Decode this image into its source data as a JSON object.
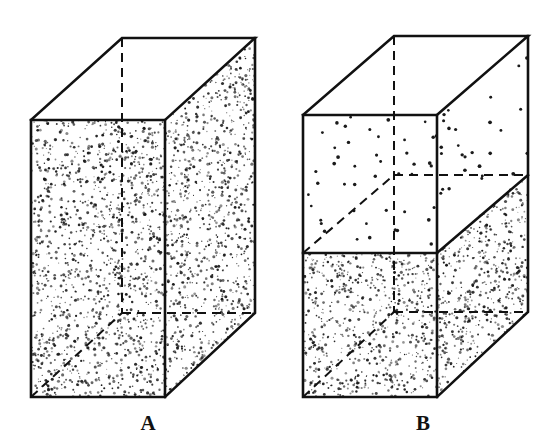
{
  "figure": {
    "background_color": "#ffffff",
    "line_color": "#111111",
    "stipple_color": "#1a1a1a",
    "panels": [
      {
        "id": "A",
        "label": "A",
        "label_x": 148,
        "label_y": 430,
        "description": "Tall rectangular box completely filled with dense stipple (uniform fill to the top edge)",
        "fill_state": "full",
        "dense_region_fraction": 1.0,
        "sparse_region_fraction": 0.0,
        "geometry": {
          "front_top_left": [
            31,
            120
          ],
          "front_top_right": [
            165,
            120
          ],
          "front_bottom_left": [
            31,
            397
          ],
          "front_bottom_right": [
            165,
            397
          ],
          "back_top_left": [
            122,
            38
          ],
          "back_top_right": [
            255,
            38
          ],
          "back_bottom_left": [
            122,
            313
          ],
          "back_bottom_right": [
            255,
            313
          ]
        },
        "hidden_edges": [
          "back_top_left-to-back_bottom_left",
          "back_bottom_left-to-back_bottom_right",
          "front_bottom_left-to-back_bottom_left"
        ],
        "fill_level_y_front": 120,
        "fill_level_y_back": 38
      },
      {
        "id": "B",
        "label": "B",
        "label_x": 423,
        "label_y": 430,
        "description": "Identical box with sparse dots in the upper half and dense stipple in the lower half, separated by a fill level line",
        "fill_state": "half",
        "dense_region_fraction": 0.5,
        "sparse_region_fraction": 0.5,
        "geometry": {
          "front_top_left": [
            303,
            115
          ],
          "front_top_right": [
            437,
            115
          ],
          "front_bottom_left": [
            303,
            397
          ],
          "front_bottom_right": [
            437,
            397
          ],
          "back_top_left": [
            394,
            36
          ],
          "back_top_right": [
            528,
            36
          ],
          "back_bottom_left": [
            394,
            312
          ],
          "back_bottom_right": [
            528,
            312
          ]
        },
        "hidden_edges": [
          "back_top_left-to-back_bottom_left",
          "back_bottom_left-to-back_bottom_right",
          "front_bottom_left-to-back_bottom_left",
          "fill_level_back_left-to-fill_level_back_right",
          "fill_level_front_left-to-fill_level_back_left"
        ],
        "fill_level_y_front": 253,
        "fill_level_y_back": 175,
        "fill_level_line_front": [
          [
            303,
            253
          ],
          [
            437,
            253
          ]
        ],
        "fill_level_line_right": [
          [
            437,
            253
          ],
          [
            528,
            175
          ]
        ],
        "fill_level_line_hidden_left": [
          [
            303,
            253
          ],
          [
            394,
            175
          ]
        ],
        "fill_level_line_hidden_back": [
          [
            394,
            175
          ],
          [
            528,
            175
          ]
        ]
      }
    ],
    "stipple": {
      "dense_dots_per_panel_face": 1400,
      "sparse_dots_per_panel_face": 90,
      "dense_dot_radius_px": [
        0.5,
        1.6
      ],
      "sparse_dot_radius_px": [
        1.3,
        1.9
      ]
    },
    "stroke_widths": {
      "solid_edge": 2.6,
      "hidden_edge": 2.0
    },
    "dash_pattern": "9,6"
  }
}
